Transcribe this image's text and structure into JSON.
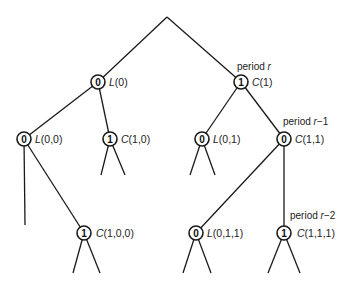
{
  "diagram": {
    "type": "binary-tree",
    "root": {
      "x": 167,
      "y": 17
    },
    "nodes": [
      {
        "id": "L0",
        "value": "0",
        "fn": "L",
        "args": "(0)",
        "x": 98,
        "y": 82
      },
      {
        "id": "C1",
        "value": "1",
        "fn": "C",
        "args": "(1)",
        "x": 241,
        "y": 82
      },
      {
        "id": "L00",
        "value": "0",
        "fn": "L",
        "args": "(0,0)",
        "x": 24,
        "y": 139
      },
      {
        "id": "C10",
        "value": "1",
        "fn": "C",
        "args": "(1,0)",
        "x": 110,
        "y": 139
      },
      {
        "id": "L01",
        "value": "0",
        "fn": "L",
        "args": "(0,1)",
        "x": 202,
        "y": 139
      },
      {
        "id": "C11",
        "value": "0",
        "fn": "C",
        "args": "(1,1)",
        "x": 284,
        "y": 139
      },
      {
        "id": "C100",
        "value": "1",
        "fn": "C",
        "args": "(1,0,0)",
        "x": 84,
        "y": 233
      },
      {
        "id": "L011",
        "value": "0",
        "fn": "L",
        "args": "(0,1,1)",
        "x": 196,
        "y": 233
      },
      {
        "id": "C111",
        "value": "1",
        "fn": "C",
        "args": "(1,1,1)",
        "x": 284,
        "y": 233
      }
    ],
    "period_labels": [
      {
        "text": "period ",
        "var": "r",
        "suffix": "",
        "x": 226,
        "y": 70
      },
      {
        "text": "period ",
        "var": "r",
        "suffix": "−1",
        "x": 282,
        "y": 125
      },
      {
        "text": "period ",
        "var": "r",
        "suffix": "−2",
        "x": 290,
        "y": 219
      }
    ],
    "node_labels": {
      "L0": "L(0)",
      "C1": "C(1)",
      "L00": "L(0,0)",
      "C10": "C(1,0)",
      "L01": "L(0,1)",
      "C11": "C(1,1)",
      "C100": "C(1,0,0)",
      "L011": "L(0,1,1)",
      "C111": "C(1,1,1)"
    },
    "period_texts": [
      "period r",
      "period r−1",
      "period r−2"
    ]
  }
}
